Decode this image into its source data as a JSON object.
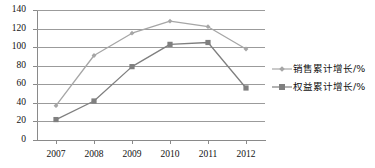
{
  "chart_data": {
    "type": "line",
    "title": "",
    "xlabel": "",
    "ylabel": "",
    "categories": [
      "2007",
      "2008",
      "2009",
      "2010",
      "2011",
      "2012"
    ],
    "ylim": [
      0,
      140
    ],
    "yticks": [
      140,
      120,
      100,
      80,
      60,
      40,
      20,
      0
    ],
    "grid": true,
    "legend_position": "right",
    "series": [
      {
        "name": "销售累计增长/%",
        "color": "#a6a6a6",
        "marker": "diamond",
        "values": [
          37,
          91,
          115,
          128,
          122,
          98
        ]
      },
      {
        "name": "权益累计增长/%",
        "color": "#7f7f7f",
        "marker": "square",
        "values": [
          22,
          42,
          79,
          103,
          105,
          56
        ]
      }
    ]
  },
  "legend": {
    "items": [
      {
        "label": "销售累计增长/%"
      },
      {
        "label": "权益累计增长/%"
      }
    ]
  },
  "colors": {
    "series_sales": "#a6a6a6",
    "series_equity": "#7f7f7f",
    "gridline": "#9b9b9b",
    "axis": "#8a8a8a",
    "text": "#111111",
    "background": "#ffffff"
  }
}
